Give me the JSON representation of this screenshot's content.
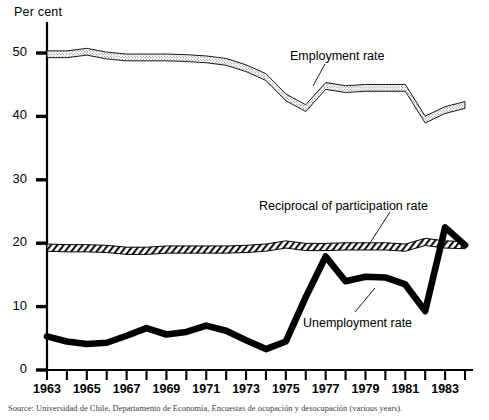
{
  "figure": {
    "y_axis_title": "Per cent",
    "source_note": "Source: Universidad de Chile, Departamento de Economía, Encuestas de ocupación y desocupación (various years)."
  },
  "labels": {
    "employment": "Employment rate",
    "participation": "Reciprocal of participation rate",
    "unemployment": "Unemployment rate"
  },
  "chart_data": {
    "type": "line",
    "title": "",
    "subtitle": "",
    "xlabel": "",
    "ylabel": "Per cent",
    "xlim": [
      1963,
      1984
    ],
    "ylim": [
      0,
      55
    ],
    "yticks": [
      0,
      10,
      20,
      30,
      40,
      50
    ],
    "ytick_labels": [
      "0",
      "10",
      "20",
      "30",
      "40",
      "50"
    ],
    "xticks": [
      1963,
      1964,
      1965,
      1966,
      1967,
      1968,
      1969,
      1970,
      1971,
      1972,
      1973,
      1974,
      1975,
      1976,
      1977,
      1978,
      1979,
      1980,
      1981,
      1982,
      1983,
      1984
    ],
    "xtick_labels": [
      "1963",
      "",
      "1965",
      "",
      "1967",
      "",
      "1969",
      "",
      "1971",
      "",
      "1973",
      "",
      "1975",
      "",
      "1977",
      "",
      "1979",
      "",
      "1981",
      "",
      "1983",
      ""
    ],
    "grid": false,
    "legend": "inline-annotations",
    "x": [
      1963,
      1964,
      1965,
      1966,
      1967,
      1968,
      1969,
      1970,
      1971,
      1972,
      1973,
      1974,
      1975,
      1976,
      1977,
      1978,
      1979,
      1980,
      1981,
      1982,
      1983,
      1984
    ],
    "series": [
      {
        "name": "Employment rate",
        "style": "stippled-band",
        "values": [
          49.8,
          49.8,
          50.2,
          49.6,
          49.3,
          49.3,
          49.3,
          49.2,
          49.0,
          48.6,
          47.6,
          46.2,
          43.0,
          41.3,
          44.8,
          44.3,
          44.5,
          44.5,
          44.5,
          39.5,
          41.0,
          41.8
        ]
      },
      {
        "name": "Reciprocal of participation rate",
        "style": "hatched-band",
        "values": [
          19.3,
          19.2,
          19.2,
          19.1,
          18.8,
          18.8,
          19.0,
          19.0,
          19.0,
          19.0,
          19.1,
          19.3,
          19.8,
          19.4,
          19.4,
          19.5,
          19.5,
          19.5,
          19.3,
          20.2,
          19.8,
          19.7
        ]
      },
      {
        "name": "Unemployment rate",
        "style": "solid-thick",
        "values": [
          5.3,
          4.5,
          4.1,
          4.3,
          5.4,
          6.6,
          5.6,
          6.0,
          7.0,
          6.2,
          4.7,
          3.3,
          4.5,
          11.5,
          17.9,
          14.0,
          14.7,
          14.6,
          13.5,
          9.3,
          22.5,
          19.7
        ]
      }
    ]
  }
}
